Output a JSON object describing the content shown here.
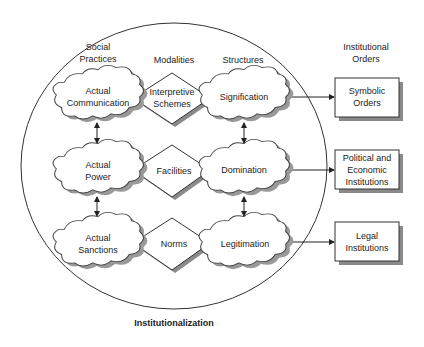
{
  "headers": {
    "social_practices_1": "Social",
    "social_practices_2": "Practices",
    "modalities": "Modalities",
    "structures": "Structures",
    "institutional_orders_1": "Institutional",
    "institutional_orders_2": "Orders"
  },
  "rows": [
    {
      "practice": [
        "Actual",
        "Communication"
      ],
      "modality": [
        "Interpretive",
        "Schemes"
      ],
      "structure": "Signification",
      "order": [
        "Symbolic",
        "Orders"
      ]
    },
    {
      "practice": [
        "Actual",
        "Power"
      ],
      "modality": [
        "Facilities"
      ],
      "structure": "Domination",
      "order": [
        "Political and",
        "Economic",
        "Institutions"
      ]
    },
    {
      "practice": [
        "Actual",
        "Sanctions"
      ],
      "modality": [
        "Norms"
      ],
      "structure": "Legitimation",
      "order": [
        "Legal",
        "Institutions"
      ]
    }
  ],
  "footer": "Institutionalization",
  "colors": {
    "stroke": "#333333",
    "shadow": "#9a9a9a",
    "fill": "#ffffff"
  }
}
